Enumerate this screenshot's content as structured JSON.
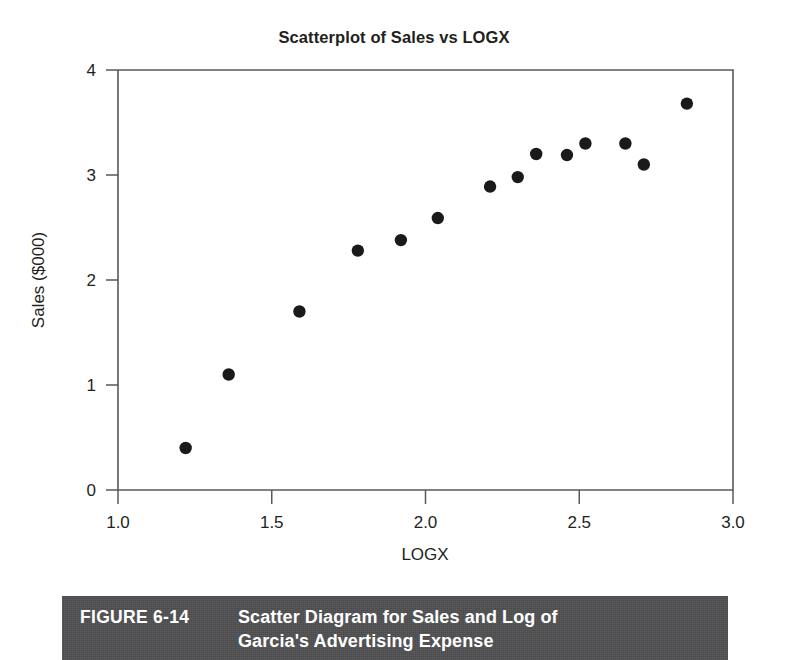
{
  "figure": {
    "number_label": "FIGURE 6-14",
    "caption_line1": "Scatter Diagram for Sales and Log of",
    "caption_line2": "Garcia's Advertising Expense",
    "bar_color": "#4f4f51",
    "bar_text_color": "#ffffff"
  },
  "chart_data": {
    "type": "scatter",
    "title": "Scatterplot of Sales vs LOGX",
    "xlabel": "LOGX",
    "ylabel": "Sales ($000)",
    "xlim": [
      1.0,
      3.0
    ],
    "ylim": [
      0,
      4
    ],
    "xticks": [
      "1.0",
      "1.5",
      "2.0",
      "2.5",
      "3.0"
    ],
    "xtick_values": [
      1.0,
      1.5,
      2.0,
      2.5,
      3.0
    ],
    "yticks": [
      "0",
      "1",
      "2",
      "3",
      "4"
    ],
    "ytick_values": [
      0,
      1,
      2,
      3,
      4
    ],
    "grid": false,
    "legend": "none",
    "marker": "filled-circle",
    "marker_color": "#1a1a1a",
    "x": [
      1.22,
      1.36,
      1.59,
      1.78,
      1.92,
      2.04,
      2.21,
      2.3,
      2.36,
      2.46,
      2.52,
      2.65,
      2.71,
      2.85
    ],
    "y": [
      0.4,
      1.1,
      1.7,
      2.28,
      2.38,
      2.59,
      2.89,
      2.98,
      3.2,
      3.19,
      3.3,
      3.3,
      3.1,
      3.68
    ],
    "n_points": 14
  }
}
